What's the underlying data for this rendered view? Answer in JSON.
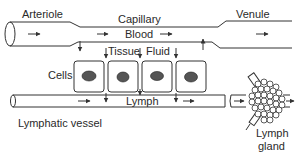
{
  "diagram": {
    "labels": {
      "arteriole": "Arteriole",
      "capillary": "Capillary",
      "blood": "Blood",
      "venule": "Venule",
      "tissue": "Tissue",
      "fluid": "Fluid",
      "cells": "Cells",
      "lymph": "Lymph",
      "lymphatic_vessel": "Lymphatic vessel",
      "lymph_gland_line1": "Lymph",
      "lymph_gland_line2": "gland"
    },
    "nodes": [
      {
        "id": "arteriole",
        "label": "Arteriole"
      },
      {
        "id": "capillary",
        "label": "Capillary",
        "contents": "Blood"
      },
      {
        "id": "venule",
        "label": "Venule"
      },
      {
        "id": "tissue_fluid",
        "label": "Tissue Fluid"
      },
      {
        "id": "cells",
        "label": "Cells",
        "count": 4
      },
      {
        "id": "lymphatic_vessel",
        "label": "Lymphatic vessel",
        "contents": "Lymph"
      },
      {
        "id": "lymph_gland",
        "label": "Lymph gland"
      }
    ],
    "edges": [
      {
        "from": "arteriole",
        "to": "capillary",
        "label": "blood flow"
      },
      {
        "from": "capillary",
        "to": "venule",
        "label": "blood flow"
      },
      {
        "from": "capillary",
        "to": "tissue_fluid",
        "label": "fluid leaves capillary"
      },
      {
        "from": "tissue_fluid",
        "to": "capillary",
        "label": "fluid returns to venous end"
      },
      {
        "from": "tissue_fluid",
        "to": "lymphatic_vessel",
        "label": "drains as lymph"
      },
      {
        "from": "lymphatic_vessel",
        "to": "lymph_gland",
        "label": "lymph flow"
      }
    ],
    "colors": {
      "line": "#333333",
      "background": "#ffffff"
    }
  }
}
